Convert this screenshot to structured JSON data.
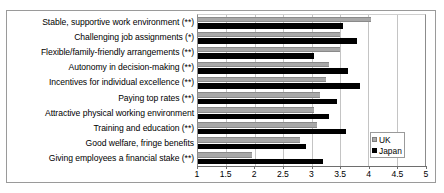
{
  "chart_data": {
    "type": "bar",
    "orientation": "horizontal",
    "title": "",
    "subtitle": "",
    "xlabel": "",
    "ylabel": "",
    "xlim": [
      1,
      5
    ],
    "grid": true,
    "gridlines_at": [
      1.5,
      2,
      2.5,
      3,
      3.5,
      4,
      4.5
    ],
    "tick_labels": [
      "1",
      "1.5",
      "2",
      "2.5",
      "3",
      "3.5",
      "4",
      "4.5",
      "5"
    ],
    "tick_values": [
      1,
      1.5,
      2,
      2.5,
      3,
      3.5,
      4,
      4.5,
      5
    ],
    "legend_position": "inside-bottom-right",
    "categories": [
      "Stable, supportive work environment (**)",
      "Challenging job assignments (*)",
      "Flexible/family-friendly arrangements  (**)",
      "Autonomy in decision-making (**)",
      "Incentives for individual excellence (**)",
      "Paying top rates (**)",
      "Attractive physical working environment",
      "Training and education (**)",
      "Good welfare, fringe benefits",
      "Giving employees a financial stake (**)"
    ],
    "series": [
      {
        "name": "UK",
        "color": "#a8a8a8",
        "values": [
          4.05,
          3.5,
          3.5,
          3.3,
          3.25,
          3.15,
          3.05,
          3.1,
          2.8,
          1.95
        ]
      },
      {
        "name": "Japan",
        "color": "#000000",
        "values": [
          3.55,
          3.8,
          3.05,
          3.65,
          3.85,
          3.45,
          3.3,
          3.6,
          2.9,
          3.2
        ]
      }
    ]
  },
  "legend": {
    "entries": [
      {
        "label": "UK",
        "swatch": "uk"
      },
      {
        "label": "Japan",
        "swatch": "japan"
      }
    ]
  }
}
